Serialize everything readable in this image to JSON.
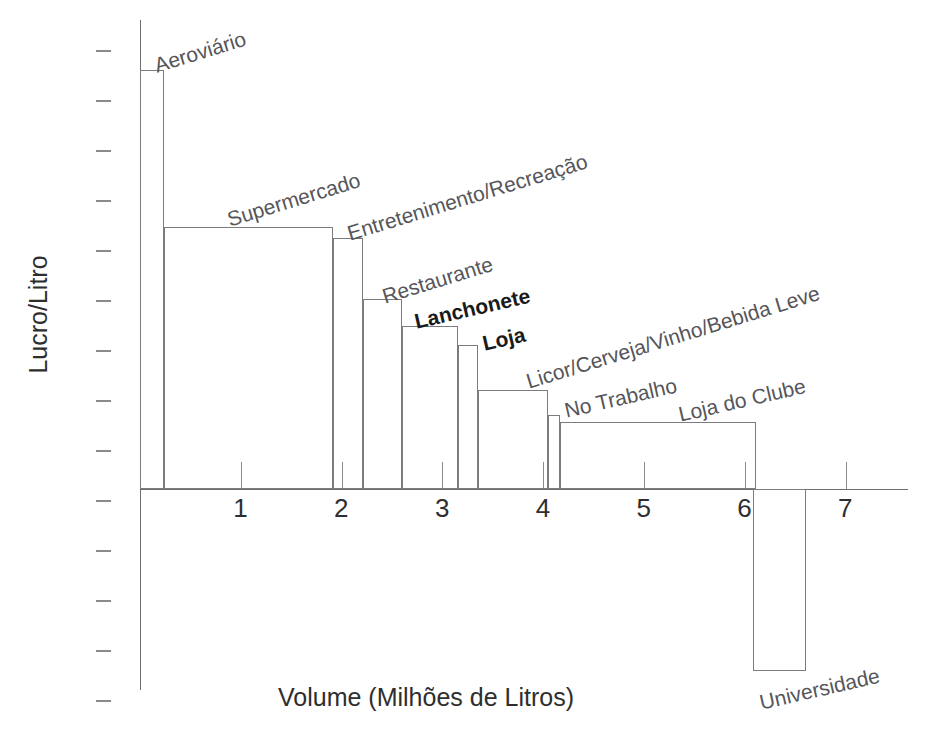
{
  "chart_data": {
    "type": "bar",
    "title": "",
    "subtitle": "",
    "xlabel": "Volume (Milhões de Litros)",
    "ylabel": "Lucro/Litro",
    "xlim": [
      0,
      7.6
    ],
    "x_ticks": [
      1,
      2,
      3,
      4,
      5,
      6,
      7
    ],
    "x_tick_labels": [
      "1",
      "2",
      "3",
      "4",
      "5",
      "6",
      "7"
    ],
    "y_ticks_count": 14,
    "y_tick_labels": [],
    "grid": false,
    "legend": "none",
    "note": "Variable-width (Marimekko/whale) bar chart: bar width = volume in millions of litres, bar height = profit per litre. Bars ordered by descending profit/litre; final category is negative.",
    "categories": [
      {
        "label": "Aeroviário",
        "x_start": 0.0,
        "x_end": 0.24,
        "width": 0.24,
        "height": 4.19,
        "bold": false
      },
      {
        "label": "Supermercado",
        "x_start": 0.24,
        "x_end": 1.91,
        "width": 1.67,
        "height": 2.62,
        "bold": false
      },
      {
        "label": "Entretenimento/Recreação",
        "x_start": 1.91,
        "x_end": 2.21,
        "width": 0.3,
        "height": 2.51,
        "bold": false
      },
      {
        "label": "Restaurante",
        "x_start": 2.21,
        "x_end": 2.6,
        "width": 0.39,
        "height": 1.9,
        "bold": false
      },
      {
        "label": "Lanchonete",
        "x_start": 2.6,
        "x_end": 3.15,
        "width": 0.55,
        "height": 1.63,
        "bold": true
      },
      {
        "label": "Loja",
        "x_start": 3.15,
        "x_end": 3.35,
        "width": 0.2,
        "height": 1.44,
        "bold": true
      },
      {
        "label": "Licor/Cerveja/Vinho/Bebida Leve",
        "x_start": 3.35,
        "x_end": 4.05,
        "width": 0.7,
        "height": 0.99,
        "bold": false
      },
      {
        "label": "No Trabalho",
        "x_start": 4.05,
        "x_end": 4.17,
        "width": 0.12,
        "height": 0.74,
        "bold": false
      },
      {
        "label": "Loja do Clube",
        "x_start": 4.17,
        "x_end": 6.11,
        "width": 1.94,
        "height": 0.67,
        "bold": false
      },
      {
        "label": "Universidade",
        "x_start": 6.08,
        "x_end": 6.61,
        "width": 0.53,
        "height": -1.82,
        "bold": false
      }
    ]
  },
  "labels": {
    "aeroviario": "Aeroviário",
    "supermercado": "Supermercado",
    "entretenimento": "Entretenimento/Recreação",
    "restaurante": "Restaurante",
    "lanchonete": "Lanchonete",
    "loja": "Loja",
    "licor": "Licor/Cerveja/Vinho/Bebida Leve",
    "no_trabalho": "No Trabalho",
    "loja_do_clube": "Loja do Clube",
    "universidade": "Universidade"
  },
  "axis": {
    "y_title": "Lucro/Litro",
    "x_title": "Volume (Milhões de Litros)",
    "x_tick_labels": [
      "1",
      "2",
      "3",
      "4",
      "5",
      "6",
      "7"
    ]
  },
  "colors": {
    "bar_stroke": "#7c7c7c",
    "axis": "#6e6e6e",
    "label_text": "#55555a",
    "bold_label_text": "#1a1a1a",
    "tick_text": "#2e2e2e",
    "background": "#ffffff"
  }
}
